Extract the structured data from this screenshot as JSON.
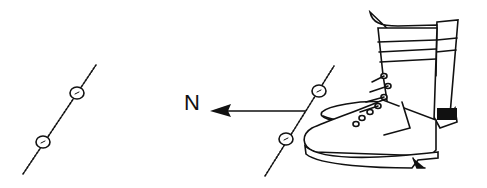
{
  "diagram": {
    "direction_label": "N",
    "colors": {
      "ink": "#111111",
      "background": "#ffffff"
    },
    "elements": [
      {
        "id": "left-line",
        "type": "dashed-line-with-two-markers"
      },
      {
        "id": "north-arrow",
        "type": "arrow",
        "points": "left",
        "label": "N"
      },
      {
        "id": "right-line",
        "type": "dashed-line-with-two-markers"
      },
      {
        "id": "boots",
        "type": "illustration",
        "description": "pair of laced boots standing beside the line"
      }
    ]
  }
}
